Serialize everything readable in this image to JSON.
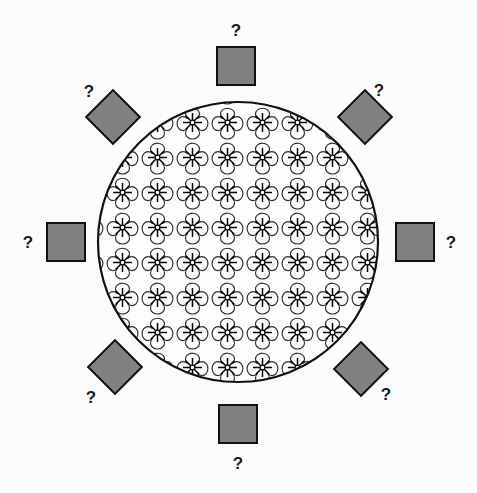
{
  "figure": {
    "canvas": {
      "width": 477,
      "height": 493,
      "background": "#fbfbfb"
    },
    "center_shape": {
      "name": "patterned-circle",
      "type": "circle",
      "cx": 238,
      "cy": 242,
      "r": 140,
      "stroke": "#111111",
      "stroke_width": 2.2,
      "fill": "#fdfdfd",
      "pattern": {
        "name": "quatrefoil-starburst",
        "tile_size": 35,
        "motif_outline_stroke": "#2a2a2a",
        "motif_outline_width": 1.1,
        "starburst_stroke": "#000000",
        "starburst_rays": 8,
        "starburst_radius": 9,
        "starburst_hub_radius": 2.4
      }
    },
    "markers": [
      {
        "id": "top",
        "shape": "square",
        "cx": 236,
        "cy": 66,
        "size": 38,
        "rotation": 0,
        "label": "?",
        "label_x": 229,
        "label_y": 22,
        "fill": "#808080",
        "stroke": "#111111"
      },
      {
        "id": "top-right",
        "shape": "diamond",
        "cx": 365,
        "cy": 117,
        "size": 38,
        "rotation": 45,
        "label": "?",
        "label_x": 372,
        "label_y": 82,
        "fill": "#808080",
        "stroke": "#111111"
      },
      {
        "id": "right",
        "shape": "square",
        "cx": 415,
        "cy": 242,
        "size": 38,
        "rotation": 0,
        "label": "?",
        "label_x": 444,
        "label_y": 234,
        "fill": "#808080",
        "stroke": "#111111"
      },
      {
        "id": "bottom-right",
        "shape": "diamond",
        "cx": 361,
        "cy": 369,
        "size": 38,
        "rotation": 45,
        "label": "?",
        "label_x": 379,
        "label_y": 386,
        "fill": "#808080",
        "stroke": "#111111"
      },
      {
        "id": "bottom",
        "shape": "square",
        "cx": 238,
        "cy": 424,
        "size": 38,
        "rotation": 0,
        "label": "?",
        "label_x": 231,
        "label_y": 455,
        "fill": "#808080",
        "stroke": "#111111"
      },
      {
        "id": "bottom-left",
        "shape": "diamond",
        "cx": 115,
        "cy": 367,
        "size": 38,
        "rotation": 45,
        "label": "?",
        "label_x": 84,
        "label_y": 389,
        "fill": "#808080",
        "stroke": "#111111"
      },
      {
        "id": "left",
        "shape": "square",
        "cx": 66,
        "cy": 242,
        "size": 38,
        "rotation": 0,
        "label": "?",
        "label_x": 21,
        "label_y": 234,
        "fill": "#808080",
        "stroke": "#111111"
      },
      {
        "id": "top-left",
        "shape": "diamond",
        "cx": 113,
        "cy": 117,
        "size": 38,
        "rotation": 45,
        "label": "?",
        "label_x": 82,
        "label_y": 83,
        "fill": "#808080",
        "stroke": "#111111"
      }
    ],
    "colors": {
      "marker_fill": "#808080",
      "marker_stroke": "#111111",
      "line": "#111111",
      "label_text": "#1a1a1a",
      "page_background": "#fbfbfb"
    },
    "counts": {
      "markers_total": 8,
      "squares": 4,
      "diamonds": 4,
      "question_marks": 8
    }
  }
}
